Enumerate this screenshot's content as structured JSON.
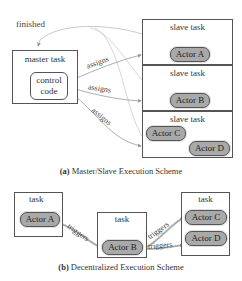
{
  "heading_cut": "",
  "diagram_a": {
    "caption_letter": "(a)",
    "caption_text": "Master/Slave Execution Scheme",
    "finished_label": "finished",
    "master": {
      "title": "master task",
      "control_line1": "control",
      "control_line2": "code"
    },
    "assign_label": "assigns",
    "slaves": [
      {
        "title": "slave task",
        "actors": [
          "Actor A"
        ]
      },
      {
        "title": "slave task",
        "actors": [
          "Actor B"
        ]
      },
      {
        "title": "slave task",
        "actors": [
          "Actor C",
          "Actor D"
        ]
      }
    ]
  },
  "diagram_b": {
    "caption_letter": "(b)",
    "caption_text": "Decentralized Execution Scheme",
    "trigger_label": "triggers",
    "tasks": [
      {
        "title": "task",
        "actors": [
          "Actor A"
        ]
      },
      {
        "title": "task",
        "actors": [
          "Actor B"
        ]
      },
      {
        "title": "task",
        "actors": [
          "Actor C",
          "Actor D"
        ]
      }
    ]
  },
  "colors": {
    "actor_fill": "#a9a9a9",
    "border": "#555555",
    "arrow": "#999999"
  }
}
